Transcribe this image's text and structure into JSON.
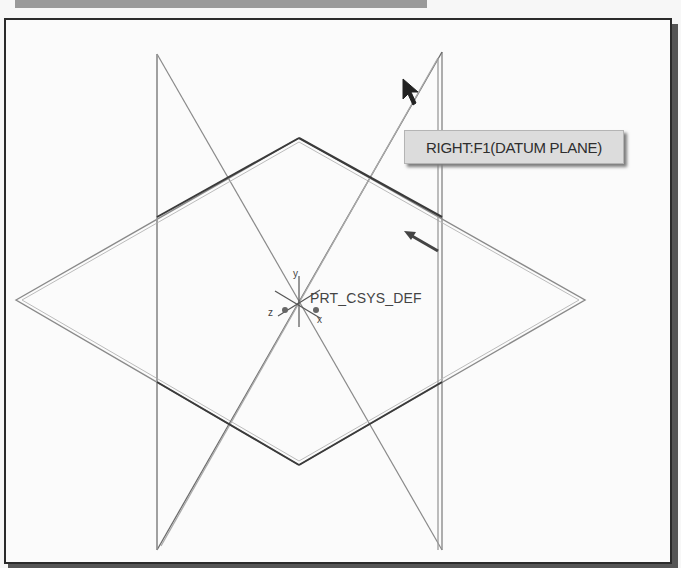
{
  "toolbar": {
    "bar": ""
  },
  "viewport": {
    "tooltip": "RIGHT:F1(DATUM PLANE)",
    "csys_label": "PRT_CSYS_DEF",
    "axes": {
      "x": "x",
      "y": "y",
      "z": "z"
    },
    "colors": {
      "frame": "#2b2b2b",
      "tooltip_bg": "#dcdcdc",
      "plane_line": "#6a6a6a",
      "highlight": "#3a3a3a"
    }
  }
}
